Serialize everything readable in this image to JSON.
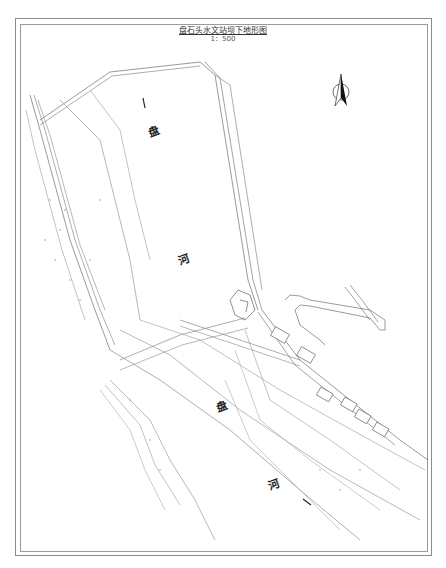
{
  "map": {
    "title": "盘石头水文站坝下地形图",
    "scale": "1：500",
    "river_labels": [
      {
        "text": "盘",
        "x": 148,
        "y": 122
      },
      {
        "text": "河",
        "x": 178,
        "y": 250
      },
      {
        "text": "盘",
        "x": 216,
        "y": 397
      },
      {
        "text": "河",
        "x": 268,
        "y": 475
      }
    ],
    "flow_arrows": [
      {
        "direction": "down",
        "x": 143,
        "y": 103
      },
      {
        "direction": "down-right",
        "x": 306,
        "y": 502
      }
    ],
    "north_arrow": {
      "icon": "north-arrow-icon",
      "x": 341,
      "y": 92
    },
    "colors": {
      "line": "#555555",
      "frame": "#8a8a8a",
      "background": "#ffffff"
    },
    "building_labels": [
      "房",
      "房",
      "房",
      "房",
      "房",
      "房"
    ]
  }
}
